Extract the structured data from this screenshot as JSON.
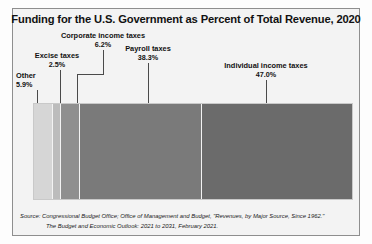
{
  "chart_data": {
    "type": "bar",
    "orientation": "horizontal",
    "stacked": true,
    "title": "Funding for the U.S. Government as Percent of Total Revenue, 2020",
    "xlabel": "",
    "ylabel": "",
    "xlim": [
      0,
      100
    ],
    "grid": false,
    "legend": "none (direct callout labels)",
    "units": "percent of total revenue",
    "categories": [
      "Other",
      "Excise taxes",
      "Corporate income taxes",
      "Payroll taxes",
      "Individual income taxes"
    ],
    "values": [
      5.9,
      2.5,
      6.2,
      38.3,
      47.0
    ],
    "value_labels": [
      "5.9%",
      "2.5%",
      "6.2%",
      "38.3%",
      "47.0%"
    ],
    "colors": [
      "#d6d6d6",
      "#bcbcbc",
      "#8f8f8f",
      "#7a7a7a",
      "#6b6b6b"
    ],
    "segments": [
      {
        "label": "Other",
        "value": 5.9,
        "value_label": "5.9%",
        "color": "#d6d6d6"
      },
      {
        "label": "Excise taxes",
        "value": 2.5,
        "value_label": "2.5%",
        "color": "#bcbcbc"
      },
      {
        "label": "Corporate income taxes",
        "value": 6.2,
        "value_label": "6.2%",
        "color": "#8f8f8f"
      },
      {
        "label": "Payroll taxes",
        "value": 38.3,
        "value_label": "38.3%",
        "color": "#7a7a7a"
      },
      {
        "label": "Individual income taxes",
        "value": 47.0,
        "value_label": "47.0%",
        "color": "#6b6b6b"
      }
    ],
    "annotations": [
      "Source: Congressional Budget Office; Office of Management and Budget, \"Revenues, by Major Source, Since 1962.\"",
      "The Budget and Economic Outlook: 2021 to 2031, February 2021."
    ]
  },
  "source": {
    "line1": "Source: Congressional Budget Office; Office of Management and Budget, \"Revenues, by Major Source, Since 1962.\"",
    "line2": "The Budget and Economic Outlook: 2021 to 2031, February 2021."
  },
  "colors": {
    "frame_border": "#8e8e8e",
    "panel_background": "#f3f3f3",
    "leader_line": "#4a4a4a",
    "text": "#111111"
  }
}
